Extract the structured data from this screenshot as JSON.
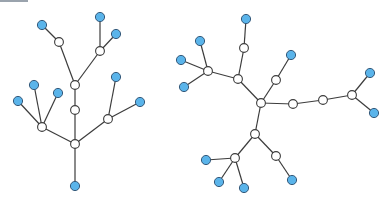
{
  "colors": {
    "leaf": "#5ab4ea",
    "inner": "#ffffff",
    "edge": "#3c3c3c",
    "topbar": "#9aa3ad"
  },
  "trees": [
    {
      "name": "left-tree",
      "nodes": [
        {
          "id": "L0",
          "x": 75,
          "y": 144,
          "type": "inner"
        },
        {
          "id": "L1",
          "x": 75,
          "y": 186,
          "type": "leaf"
        },
        {
          "id": "L2",
          "x": 42,
          "y": 127,
          "type": "inner"
        },
        {
          "id": "L3",
          "x": 18,
          "y": 101,
          "type": "leaf"
        },
        {
          "id": "L4",
          "x": 34,
          "y": 85,
          "type": "leaf"
        },
        {
          "id": "L5",
          "x": 58,
          "y": 93,
          "type": "leaf"
        },
        {
          "id": "L6",
          "x": 108,
          "y": 119,
          "type": "inner"
        },
        {
          "id": "L7",
          "x": 140,
          "y": 102,
          "type": "leaf"
        },
        {
          "id": "L8",
          "x": 116,
          "y": 77,
          "type": "leaf"
        },
        {
          "id": "L9",
          "x": 75,
          "y": 110,
          "type": "inner"
        },
        {
          "id": "L10",
          "x": 75,
          "y": 85,
          "type": "inner"
        },
        {
          "id": "L11",
          "x": 59,
          "y": 42,
          "type": "inner"
        },
        {
          "id": "L12",
          "x": 42,
          "y": 25,
          "type": "leaf"
        },
        {
          "id": "L13",
          "x": 100,
          "y": 51,
          "type": "inner"
        },
        {
          "id": "L14",
          "x": 100,
          "y": 17,
          "type": "leaf"
        },
        {
          "id": "L15",
          "x": 116,
          "y": 34,
          "type": "leaf"
        }
      ],
      "edges": [
        [
          "L0",
          "L1"
        ],
        [
          "L0",
          "L2"
        ],
        [
          "L2",
          "L3"
        ],
        [
          "L2",
          "L4"
        ],
        [
          "L2",
          "L5"
        ],
        [
          "L0",
          "L6"
        ],
        [
          "L6",
          "L7"
        ],
        [
          "L6",
          "L8"
        ],
        [
          "L0",
          "L9"
        ],
        [
          "L9",
          "L10"
        ],
        [
          "L10",
          "L11"
        ],
        [
          "L11",
          "L12"
        ],
        [
          "L10",
          "L13"
        ],
        [
          "L13",
          "L14"
        ],
        [
          "L13",
          "L15"
        ]
      ]
    },
    {
      "name": "right-tree",
      "nodes": [
        {
          "id": "R0",
          "x": 261,
          "y": 103,
          "type": "inner"
        },
        {
          "id": "R1",
          "x": 238,
          "y": 79,
          "type": "inner"
        },
        {
          "id": "R2",
          "x": 208,
          "y": 71,
          "type": "inner"
        },
        {
          "id": "R3",
          "x": 200,
          "y": 41,
          "type": "leaf"
        },
        {
          "id": "R4",
          "x": 181,
          "y": 60,
          "type": "leaf"
        },
        {
          "id": "R5",
          "x": 184,
          "y": 87,
          "type": "leaf"
        },
        {
          "id": "R6",
          "x": 244,
          "y": 48,
          "type": "inner"
        },
        {
          "id": "R7",
          "x": 246,
          "y": 19,
          "type": "leaf"
        },
        {
          "id": "R8",
          "x": 276,
          "y": 80,
          "type": "inner"
        },
        {
          "id": "R9",
          "x": 291,
          "y": 55,
          "type": "leaf"
        },
        {
          "id": "R10",
          "x": 293,
          "y": 104,
          "type": "inner"
        },
        {
          "id": "R11",
          "x": 323,
          "y": 100,
          "type": "inner"
        },
        {
          "id": "R12",
          "x": 352,
          "y": 95,
          "type": "inner"
        },
        {
          "id": "R13",
          "x": 370,
          "y": 73,
          "type": "leaf"
        },
        {
          "id": "R14",
          "x": 374,
          "y": 113,
          "type": "leaf"
        },
        {
          "id": "R15",
          "x": 255,
          "y": 134,
          "type": "inner"
        },
        {
          "id": "R16",
          "x": 235,
          "y": 158,
          "type": "inner"
        },
        {
          "id": "R17",
          "x": 206,
          "y": 160,
          "type": "leaf"
        },
        {
          "id": "R18",
          "x": 219,
          "y": 182,
          "type": "leaf"
        },
        {
          "id": "R19",
          "x": 244,
          "y": 188,
          "type": "leaf"
        },
        {
          "id": "R20",
          "x": 276,
          "y": 156,
          "type": "inner"
        },
        {
          "id": "R21",
          "x": 292,
          "y": 180,
          "type": "leaf"
        }
      ],
      "edges": [
        [
          "R0",
          "R1"
        ],
        [
          "R1",
          "R2"
        ],
        [
          "R2",
          "R3"
        ],
        [
          "R2",
          "R4"
        ],
        [
          "R2",
          "R5"
        ],
        [
          "R1",
          "R6"
        ],
        [
          "R6",
          "R7"
        ],
        [
          "R0",
          "R8"
        ],
        [
          "R8",
          "R9"
        ],
        [
          "R0",
          "R10"
        ],
        [
          "R10",
          "R11"
        ],
        [
          "R11",
          "R12"
        ],
        [
          "R12",
          "R13"
        ],
        [
          "R12",
          "R14"
        ],
        [
          "R0",
          "R15"
        ],
        [
          "R15",
          "R16"
        ],
        [
          "R16",
          "R17"
        ],
        [
          "R16",
          "R18"
        ],
        [
          "R16",
          "R19"
        ],
        [
          "R15",
          "R20"
        ],
        [
          "R20",
          "R21"
        ]
      ]
    }
  ]
}
